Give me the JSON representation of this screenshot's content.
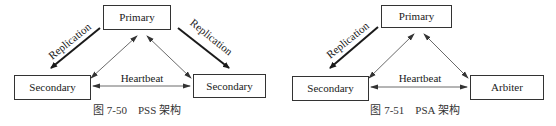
{
  "figures": [
    {
      "id": "pss",
      "caption": "图 7-50　PSS 架构",
      "nodes": {
        "primary": "Primary",
        "left": "Secondary",
        "right": "Secondary"
      },
      "edges": {
        "replication_left": "Replication",
        "replication_right": "Replication",
        "heartbeat": "Heartbeat"
      }
    },
    {
      "id": "psa",
      "caption": "图 7-51　PSA 架构",
      "nodes": {
        "primary": "Primary",
        "left": "Secondary",
        "right": "Arbiter"
      },
      "edges": {
        "replication_left": "Replication",
        "heartbeat": "Heartbeat"
      }
    }
  ],
  "colors": {
    "stroke": "#333333",
    "text": "#1a1a1a",
    "background": "#ffffff"
  }
}
